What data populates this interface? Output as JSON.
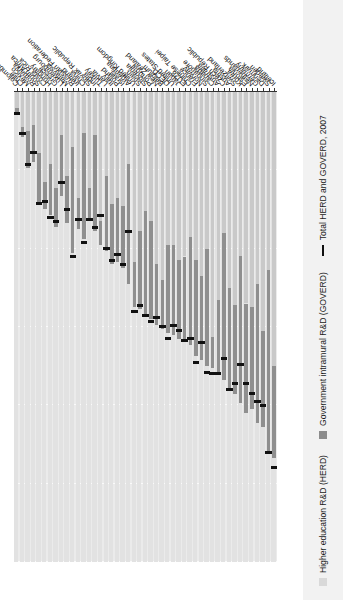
{
  "chart_data": {
    "type": "bar",
    "subtype": "horizontal-stacked-bar-with-marker",
    "title": "",
    "xlabel": "%",
    "ylabel": "",
    "xlim": [
      0.0,
      1.2
    ],
    "x_axis_reversed": true,
    "xticks": [
      0.0,
      0.2,
      0.4,
      0.6,
      0.8,
      1.0,
      1.2
    ],
    "xticklabels": [
      "0.0",
      "0.2",
      "0.4",
      "0.6",
      "0.8",
      "1.0",
      "1.2"
    ],
    "grid": true,
    "legend_position": "bottom-left",
    "legend": [
      {
        "key": "herd",
        "label": "Higher education R&D (HERD)",
        "color": "#c9c9c9",
        "marker": "square"
      },
      {
        "key": "goverd",
        "label": "Government intramural  R&D (GOVERD)",
        "color": "#8f8f8f",
        "marker": "square"
      },
      {
        "key": "total",
        "label": "Total HERD and GOVERD, 2007",
        "color": "#111111",
        "marker": "line"
      }
    ],
    "series": [
      {
        "name": "Higher education R&D (HERD)",
        "key": "herd",
        "color": "#c9c9c9"
      },
      {
        "name": "Government intramural R&D (GOVERD)",
        "key": "goverd",
        "color": "#8f8f8f"
      },
      {
        "name": "Total HERD and GOVERD, 2007",
        "key": "total",
        "color": "#111111"
      }
    ],
    "categories": [
      "Colombia",
      "Chile",
      "Mexico",
      "Romania",
      "South Africa",
      "Costa Rica",
      "Hungary",
      "Greece",
      "Luxembourg",
      "Malaysia",
      "Russian Federation",
      "Ireland",
      "China",
      "Slovak Republic",
      "India",
      "Turkey",
      "Latvia",
      "Italy",
      "Poland",
      "Israel",
      "Argentina",
      "United Kingdom",
      "Spain",
      "Slovenia",
      "Portugal",
      "New Zealand",
      "Belgium",
      "OECD",
      "United States",
      "Japan",
      "EU28",
      "Chinese Taipei",
      "France",
      "Norway",
      "Singapore",
      "Canada",
      "Australia",
      "Czech Republic",
      "Austria",
      "Switzerland",
      "Korea",
      "Estonia",
      "Netherlands",
      "Germany",
      "Denmark",
      "Sweden",
      "Iceland"
    ],
    "values": {
      "herd": [
        0.04,
        0.09,
        0.1,
        0.085,
        0.155,
        0.23,
        0.185,
        0.245,
        0.11,
        0.215,
        0.14,
        0.27,
        0.105,
        0.245,
        0.11,
        0.33,
        0.215,
        0.285,
        0.27,
        0.29,
        0.185,
        0.435,
        0.355,
        0.305,
        0.33,
        0.44,
        0.48,
        0.39,
        0.39,
        0.43,
        0.42,
        0.37,
        0.43,
        0.47,
        0.4,
        0.625,
        0.53,
        0.36,
        0.5,
        0.545,
        0.42,
        0.54,
        0.55,
        0.49,
        0.61,
        0.455,
        0.7
      ],
      "goverd": [
        0.02,
        0.025,
        0.095,
        0.095,
        0.125,
        0.07,
        0.13,
        0.1,
        0.155,
        0.12,
        0.27,
        0.08,
        0.27,
        0.085,
        0.245,
        0.06,
        0.19,
        0.155,
        0.165,
        0.16,
        0.305,
        0.115,
        0.2,
        0.265,
        0.25,
        0.155,
        0.125,
        0.225,
        0.23,
        0.2,
        0.215,
        0.275,
        0.245,
        0.215,
        0.3,
        0.08,
        0.19,
        0.375,
        0.255,
        0.225,
        0.375,
        0.28,
        0.26,
        0.355,
        0.245,
        0.465,
        0.235
      ]
    },
    "totals_2007": [
      0.055,
      0.105,
      0.185,
      0.155,
      0.285,
      0.28,
      0.32,
      0.33,
      0.23,
      0.3,
      0.42,
      0.325,
      0.385,
      0.325,
      0.345,
      0.315,
      0.4,
      0.43,
      0.415,
      0.44,
      0.355,
      0.56,
      0.545,
      0.57,
      0.585,
      0.575,
      0.6,
      0.63,
      0.595,
      0.61,
      0.635,
      0.63,
      0.69,
      0.64,
      0.715,
      0.72,
      0.72,
      0.68,
      0.76,
      0.745,
      0.695,
      0.745,
      0.77,
      0.79,
      0.8,
      0.92,
      0.96
    ]
  }
}
